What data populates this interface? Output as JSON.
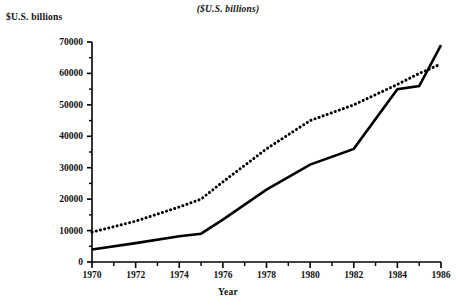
{
  "subtitle": "($U.S. billions)",
  "ylabel": "$U.S. billions",
  "xlabel": "Year",
  "chart_data": {
    "type": "line",
    "title": "",
    "subtitle": "($U.S. billions)",
    "xlabel": "Year",
    "ylabel": "$U.S. billions",
    "xlim": [
      1970,
      1986
    ],
    "ylim": [
      0,
      70000
    ],
    "grid": false,
    "legend": "none",
    "x_major_ticks": [
      1970,
      1972,
      1974,
      1976,
      1978,
      1980,
      1982,
      1984,
      1986
    ],
    "x_tick_labels": [
      "1970",
      "1972",
      "1974",
      "1976",
      "1978",
      "1980",
      "1982",
      "1984",
      "1986"
    ],
    "x_minor_ticks": [
      1971,
      1973,
      1975,
      1977,
      1979,
      1981,
      1983,
      1985
    ],
    "y_major_ticks": [
      0,
      10000,
      20000,
      30000,
      40000,
      50000,
      60000,
      70000
    ],
    "y_tick_labels": [
      "0",
      "10000",
      "20000",
      "30000",
      "40000",
      "50000",
      "60000",
      "70000"
    ],
    "y_minor_ticks": [
      5000,
      15000,
      25000,
      35000,
      45000,
      55000,
      65000
    ],
    "series": [
      {
        "name": "dotted-series",
        "style": "dotted",
        "color": "#000000",
        "x": [
          1970,
          1972,
          1974,
          1975,
          1976,
          1978,
          1980,
          1982,
          1984,
          1985,
          1986
        ],
        "values": [
          9500,
          13000,
          17500,
          20000,
          25500,
          36000,
          45000,
          50000,
          56500,
          60000,
          63000
        ]
      },
      {
        "name": "solid-series",
        "style": "solid",
        "color": "#000000",
        "x": [
          1970,
          1972,
          1974,
          1975,
          1976,
          1978,
          1980,
          1982,
          1984,
          1985,
          1986
        ],
        "values": [
          4000,
          6000,
          8200,
          9000,
          13500,
          23000,
          31000,
          36000,
          55000,
          56000,
          69000
        ]
      }
    ]
  }
}
